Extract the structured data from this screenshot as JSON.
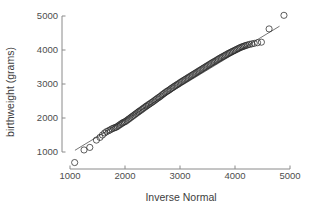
{
  "figure": {
    "background_color": "#ffffff",
    "axis_color": "#8a8a8a",
    "marker_color": "#2a2a2a",
    "reference_line_color": "#3a3a3a"
  },
  "chart_data": {
    "type": "scatter",
    "title": "",
    "subtitle": "",
    "xlabel": "Inverse Normal",
    "ylabel": "birthweight (grams)",
    "xlim": [
      700,
      5200
    ],
    "ylim": [
      560,
      5200
    ],
    "xticks": [
      1000,
      2000,
      3000,
      4000,
      5000
    ],
    "yticks": [
      1000,
      2000,
      3000,
      4000,
      5000
    ],
    "xticklabels": [
      "1000",
      "2000",
      "3000",
      "4000",
      "5000"
    ],
    "yticklabels": [
      "1000",
      "2000",
      "3000",
      "4000",
      "5000"
    ],
    "grid": false,
    "legend": null,
    "marker": "open-circle",
    "marker_size": 3.1,
    "annotations": [],
    "reference_line": {
      "label": "45-degree reference line",
      "x": [
        1090,
        4810
      ],
      "y": [
        1050,
        4700
      ]
    },
    "series": [
      {
        "name": "birthweight quantiles",
        "points": [
          [
            1085,
            690
          ],
          [
            1255,
            1060
          ],
          [
            1360,
            1135
          ],
          [
            1480,
            1350
          ],
          [
            1545,
            1430
          ],
          [
            1590,
            1500
          ],
          [
            1630,
            1560
          ],
          [
            1665,
            1600
          ],
          [
            1700,
            1625
          ],
          [
            1730,
            1650
          ],
          [
            1760,
            1680
          ],
          [
            1790,
            1700
          ],
          [
            1815,
            1715
          ],
          [
            1840,
            1730
          ],
          [
            1865,
            1755
          ],
          [
            1890,
            1785
          ],
          [
            1915,
            1810
          ],
          [
            1940,
            1840
          ],
          [
            1960,
            1860
          ],
          [
            1985,
            1880
          ],
          [
            2010,
            1900
          ],
          [
            2035,
            1930
          ],
          [
            2060,
            1960
          ],
          [
            2085,
            1990
          ],
          [
            2110,
            2020
          ],
          [
            2135,
            2050
          ],
          [
            2160,
            2080
          ],
          [
            2185,
            2110
          ],
          [
            2210,
            2140
          ],
          [
            2235,
            2170
          ],
          [
            2255,
            2195
          ],
          [
            2280,
            2220
          ],
          [
            2305,
            2250
          ],
          [
            2330,
            2280
          ],
          [
            2355,
            2310
          ],
          [
            2380,
            2340
          ],
          [
            2400,
            2360
          ],
          [
            2425,
            2390
          ],
          [
            2450,
            2415
          ],
          [
            2475,
            2445
          ],
          [
            2500,
            2470
          ],
          [
            2525,
            2500
          ],
          [
            2550,
            2530
          ],
          [
            2575,
            2560
          ],
          [
            2600,
            2590
          ],
          [
            2625,
            2615
          ],
          [
            2650,
            2645
          ],
          [
            2675,
            2680
          ],
          [
            2700,
            2710
          ],
          [
            2725,
            2740
          ],
          [
            2750,
            2770
          ],
          [
            2775,
            2795
          ],
          [
            2800,
            2820
          ],
          [
            2825,
            2850
          ],
          [
            2850,
            2880
          ],
          [
            2875,
            2905
          ],
          [
            2900,
            2935
          ],
          [
            2925,
            2960
          ],
          [
            2950,
            2985
          ],
          [
            2975,
            3010
          ],
          [
            3000,
            3040
          ],
          [
            3025,
            3065
          ],
          [
            3050,
            3090
          ],
          [
            3075,
            3115
          ],
          [
            3100,
            3140
          ],
          [
            3125,
            3165
          ],
          [
            3150,
            3190
          ],
          [
            3175,
            3215
          ],
          [
            3200,
            3240
          ],
          [
            3225,
            3265
          ],
          [
            3250,
            3290
          ],
          [
            3275,
            3315
          ],
          [
            3300,
            3340
          ],
          [
            3325,
            3365
          ],
          [
            3350,
            3390
          ],
          [
            3375,
            3415
          ],
          [
            3400,
            3440
          ],
          [
            3425,
            3465
          ],
          [
            3450,
            3490
          ],
          [
            3475,
            3515
          ],
          [
            3500,
            3540
          ],
          [
            3525,
            3565
          ],
          [
            3550,
            3590
          ],
          [
            3575,
            3615
          ],
          [
            3600,
            3640
          ],
          [
            3625,
            3660
          ],
          [
            3650,
            3685
          ],
          [
            3675,
            3710
          ],
          [
            3700,
            3735
          ],
          [
            3725,
            3760
          ],
          [
            3750,
            3780
          ],
          [
            3775,
            3805
          ],
          [
            3800,
            3825
          ],
          [
            3825,
            3850
          ],
          [
            3850,
            3870
          ],
          [
            3875,
            3895
          ],
          [
            3900,
            3915
          ],
          [
            3925,
            3935
          ],
          [
            3950,
            3955
          ],
          [
            3975,
            3975
          ],
          [
            4000,
            3995
          ],
          [
            4025,
            4015
          ],
          [
            4050,
            4035
          ],
          [
            4075,
            4055
          ],
          [
            4100,
            4075
          ],
          [
            4125,
            4090
          ],
          [
            4150,
            4105
          ],
          [
            4175,
            4120
          ],
          [
            4200,
            4135
          ],
          [
            4230,
            4150
          ],
          [
            4265,
            4165
          ],
          [
            4305,
            4180
          ],
          [
            4350,
            4195
          ],
          [
            4410,
            4215
          ],
          [
            4480,
            4230
          ],
          [
            4620,
            4620
          ],
          [
            4890,
            5020
          ]
        ]
      }
    ]
  },
  "axes": {
    "x_axis_name": "x-axis",
    "y_axis_name": "y-axis"
  }
}
